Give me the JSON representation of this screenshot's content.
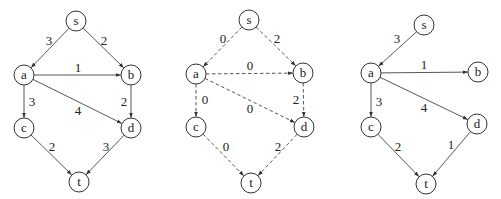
{
  "node_radius": 10,
  "colors": {
    "stroke": "#333333",
    "edge": "#444444",
    "text": "#222222",
    "background": "#ffffff"
  },
  "graphs": [
    {
      "id": "graph-original",
      "style": "solid",
      "nodes": [
        {
          "id": "s",
          "label": "s",
          "x": 76,
          "y": 21
        },
        {
          "id": "a",
          "label": "a",
          "x": 24,
          "y": 75
        },
        {
          "id": "b",
          "label": "b",
          "x": 131,
          "y": 75
        },
        {
          "id": "c",
          "label": "c",
          "x": 24,
          "y": 128
        },
        {
          "id": "d",
          "label": "d",
          "x": 131,
          "y": 128
        },
        {
          "id": "t",
          "label": "t",
          "x": 79,
          "y": 182
        }
      ],
      "edges": [
        {
          "from": "s",
          "to": "a",
          "label": "3",
          "lx": 49,
          "ly": 40
        },
        {
          "from": "s",
          "to": "b",
          "label": "2",
          "lx": 104,
          "ly": 40
        },
        {
          "from": "a",
          "to": "b",
          "label": "1",
          "lx": 78,
          "ly": 67
        },
        {
          "from": "a",
          "to": "c",
          "label": "3",
          "lx": 32,
          "ly": 101
        },
        {
          "from": "a",
          "to": "d",
          "label": "4",
          "lx": 78,
          "ly": 110
        },
        {
          "from": "b",
          "to": "d",
          "label": "2",
          "lx": 124,
          "ly": 101
        },
        {
          "from": "c",
          "to": "t",
          "label": "2",
          "lx": 52,
          "ly": 146
        },
        {
          "from": "d",
          "to": "t",
          "label": "3",
          "lx": 106,
          "ly": 146
        }
      ]
    },
    {
      "id": "graph-reduced-costs",
      "style": "dashed",
      "nodes": [
        {
          "id": "s",
          "label": "s",
          "x": 249,
          "y": 20
        },
        {
          "id": "a",
          "label": "a",
          "x": 196,
          "y": 74
        },
        {
          "id": "b",
          "label": "b",
          "x": 303,
          "y": 73
        },
        {
          "id": "c",
          "label": "c",
          "x": 196,
          "y": 127
        },
        {
          "id": "d",
          "label": "d",
          "x": 304,
          "y": 127
        },
        {
          "id": "t",
          "label": "t",
          "x": 251,
          "y": 183
        }
      ],
      "edges": [
        {
          "from": "s",
          "to": "a",
          "label": "0",
          "lx": 223,
          "ly": 38
        },
        {
          "from": "s",
          "to": "b",
          "label": "2",
          "lx": 277,
          "ly": 38
        },
        {
          "from": "a",
          "to": "b",
          "label": "0",
          "lx": 250,
          "ly": 65
        },
        {
          "from": "a",
          "to": "c",
          "label": "0",
          "lx": 205,
          "ly": 99
        },
        {
          "from": "a",
          "to": "d",
          "label": "0",
          "lx": 250,
          "ly": 108
        },
        {
          "from": "b",
          "to": "d",
          "label": "2",
          "lx": 296,
          "ly": 99
        },
        {
          "from": "c",
          "to": "t",
          "label": "0",
          "lx": 226,
          "ly": 146
        },
        {
          "from": "d",
          "to": "t",
          "label": "2",
          "lx": 278,
          "ly": 146
        }
      ]
    },
    {
      "id": "graph-shortest-path-tree",
      "style": "solid",
      "nodes": [
        {
          "id": "s",
          "label": "s",
          "x": 424,
          "y": 25
        },
        {
          "id": "a",
          "label": "a",
          "x": 371,
          "y": 73
        },
        {
          "id": "b",
          "label": "b",
          "x": 478,
          "y": 72
        },
        {
          "id": "c",
          "label": "c",
          "x": 371,
          "y": 127
        },
        {
          "id": "d",
          "label": "d",
          "x": 477,
          "y": 124
        },
        {
          "id": "t",
          "label": "t",
          "x": 426,
          "y": 184
        }
      ],
      "edges": [
        {
          "from": "s",
          "to": "a",
          "label": "3",
          "lx": 397,
          "ly": 38
        },
        {
          "from": "a",
          "to": "b",
          "label": "1",
          "lx": 424,
          "ly": 64
        },
        {
          "from": "a",
          "to": "c",
          "label": "3",
          "lx": 379,
          "ly": 101
        },
        {
          "from": "a",
          "to": "d",
          "label": "4",
          "lx": 424,
          "ly": 107
        },
        {
          "from": "c",
          "to": "t",
          "label": "2",
          "lx": 398,
          "ly": 146
        },
        {
          "from": "d",
          "to": "t",
          "label": "1",
          "lx": 451,
          "ly": 144
        }
      ]
    }
  ]
}
